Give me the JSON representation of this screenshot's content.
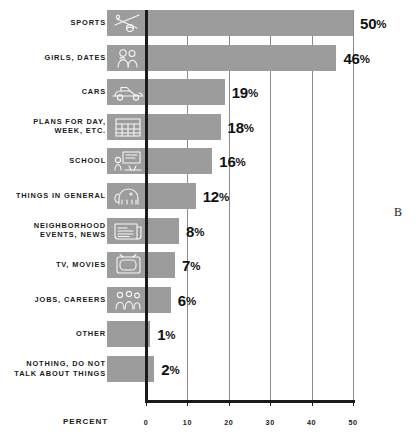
{
  "chart_data": {
    "type": "bar",
    "orientation": "horizontal",
    "title": "",
    "xlabel": "PERCENT",
    "ylabel": "",
    "xlim": [
      0,
      50
    ],
    "xticks": [
      0,
      10,
      20,
      30,
      40,
      50
    ],
    "xtick_labels": [
      "0",
      "10",
      "20",
      "30",
      "40",
      "50"
    ],
    "grid": true,
    "legend": null,
    "value_suffix": "%",
    "categories": [
      "SPORTS",
      "GIRLS, DATES",
      "CARS",
      "PLANS FOR DAY,\nWEEK, ETC.",
      "SCHOOL",
      "THINGS IN GENERAL",
      "NEIGHBORHOOD\nEVENTS, NEWS",
      "TV, MOVIES",
      "JOBS, CAREERS",
      "OTHER",
      "NOTHING, DO NOT\nTALK ABOUT THINGS"
    ],
    "values": [
      50,
      46,
      19,
      18,
      16,
      12,
      8,
      7,
      6,
      1,
      2
    ],
    "value_labels": [
      "50%",
      "46%",
      "19%",
      "18%",
      "16%",
      "12%",
      "8%",
      "7%",
      "6%",
      "1%",
      "2%"
    ],
    "bar_icons": [
      "sports-icon",
      "couple-dating-icon",
      "car-icon",
      "calendar-icon",
      "school-icon",
      "elephant-icon",
      "newspaper-icon",
      "television-icon",
      "workers-icon",
      null,
      null
    ],
    "colors": {
      "bar": "#9c9c9c",
      "axis": "#1b1b1b",
      "gridline": "#8a8a8a",
      "background": "#ffffff",
      "text": "#1b1b1b"
    }
  },
  "annotations": {
    "plate_mark": "B"
  }
}
